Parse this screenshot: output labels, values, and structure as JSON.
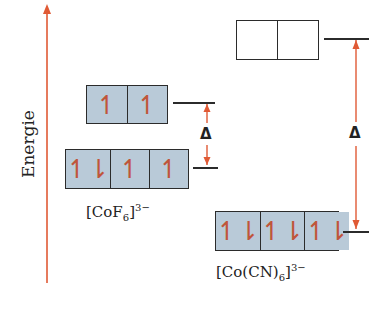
{
  "axis": {
    "label": "Energie",
    "color": "#e05a35"
  },
  "complexes": [
    {
      "name": "[CoF6]3-",
      "label_main": "[CoF",
      "label_sub": "6",
      "label_close": "]",
      "label_sup": "3−",
      "eg": {
        "cells": [
          "↿",
          "↿"
        ],
        "filled": true
      },
      "t2g": {
        "cells": [
          "↿⇂",
          "↿",
          "↿"
        ],
        "filled": true
      },
      "delta": "Δ",
      "splitting": "small"
    },
    {
      "name": "[Co(CN)6]3-",
      "label_main": "[Co(CN)",
      "label_sub": "6",
      "label_close": "]",
      "label_sup": "3−",
      "eg": {
        "cells": [
          "",
          ""
        ],
        "filled": false
      },
      "t2g": {
        "cells": [
          "↿⇂",
          "↿⇂",
          "↿⇂"
        ],
        "filled": true
      },
      "delta": "Δ",
      "splitting": "large"
    }
  ],
  "colors": {
    "orbital_fill": "#b9cad8",
    "arrow": "#e05a35",
    "electron": "#c0553a",
    "line": "#2b2b2b"
  }
}
